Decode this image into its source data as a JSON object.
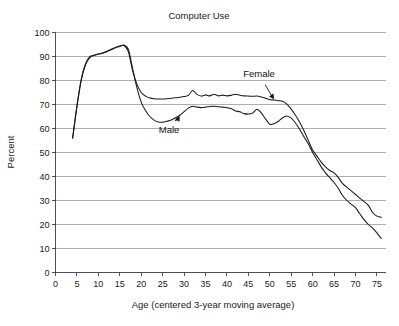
{
  "chart_data": {
    "type": "line",
    "title": "Computer Use",
    "xlabel": "Age (centered 3-year moving average)",
    "ylabel": "Percent",
    "xlim": [
      0,
      77
    ],
    "ylim": [
      0,
      100
    ],
    "xticks": [
      0,
      5,
      10,
      15,
      20,
      25,
      30,
      35,
      40,
      45,
      50,
      55,
      60,
      65,
      70,
      75
    ],
    "yticks": [
      0,
      10,
      20,
      30,
      40,
      50,
      60,
      70,
      80,
      90,
      100
    ],
    "grid": "horizontal",
    "legend": "inline-annotations",
    "annotations": [
      {
        "label": "Female",
        "series": "Female",
        "text_x": 47.5,
        "text_y": 81.5,
        "point_x": 51.0,
        "point_y": 72.2
      },
      {
        "label": "Male",
        "series": "Male",
        "text_x": 26.5,
        "text_y": 58.0,
        "point_x": 29.0,
        "point_y": 65.2
      }
    ],
    "x": [
      4,
      5,
      6,
      7,
      8,
      9,
      10,
      11,
      12,
      13,
      14,
      15,
      16,
      17,
      18,
      19,
      20,
      21,
      22,
      23,
      24,
      25,
      26,
      27,
      28,
      29,
      30,
      31,
      32,
      33,
      34,
      35,
      36,
      37,
      38,
      39,
      40,
      41,
      42,
      43,
      44,
      45,
      46,
      47,
      48,
      49,
      50,
      51,
      52,
      53,
      54,
      55,
      56,
      57,
      58,
      59,
      60,
      61,
      62,
      63,
      64,
      65,
      66,
      67,
      68,
      69,
      70,
      71,
      72,
      73,
      74,
      75,
      76
    ],
    "series": [
      {
        "name": "Female",
        "values": [
          56.0,
          69.0,
          80.0,
          86.5,
          89.5,
          90.5,
          91.0,
          91.5,
          92.2,
          93.0,
          93.8,
          94.4,
          94.6,
          92.0,
          84.0,
          78.5,
          75.0,
          73.5,
          72.7,
          72.4,
          72.3,
          72.3,
          72.4,
          72.6,
          72.8,
          73.0,
          73.3,
          73.8,
          75.8,
          74.2,
          73.5,
          74.0,
          73.6,
          74.3,
          73.6,
          73.9,
          73.6,
          73.8,
          74.3,
          73.9,
          73.6,
          73.5,
          73.4,
          73.5,
          73.1,
          72.6,
          72.0,
          71.9,
          71.6,
          71.4,
          70.2,
          68.1,
          65.5,
          62.5,
          59.0,
          55.0,
          51.0,
          48.5,
          46.0,
          44.0,
          42.5,
          41.5,
          39.5,
          37.0,
          35.5,
          34.0,
          32.5,
          31.0,
          29.5,
          28.0,
          25.0,
          23.5,
          23.0
        ]
      },
      {
        "name": "Male",
        "values": [
          56.0,
          69.5,
          80.5,
          87.0,
          90.0,
          90.5,
          91.0,
          91.4,
          92.0,
          92.8,
          93.6,
          94.2,
          94.8,
          93.0,
          85.0,
          77.0,
          71.0,
          67.5,
          65.0,
          63.5,
          62.7,
          62.6,
          63.0,
          63.5,
          64.5,
          65.5,
          67.0,
          68.5,
          69.3,
          68.9,
          68.7,
          68.9,
          69.2,
          69.3,
          69.1,
          68.9,
          68.7,
          68.3,
          67.3,
          67.0,
          66.2,
          66.0,
          66.4,
          68.0,
          66.5,
          64.0,
          61.8,
          62.0,
          63.0,
          64.5,
          65.2,
          64.3,
          62.3,
          59.6,
          56.5,
          53.5,
          50.0,
          47.0,
          44.0,
          41.5,
          39.5,
          37.5,
          35.0,
          32.0,
          30.0,
          28.5,
          27.0,
          24.5,
          22.0,
          20.0,
          18.5,
          16.5,
          14.2
        ]
      }
    ]
  }
}
